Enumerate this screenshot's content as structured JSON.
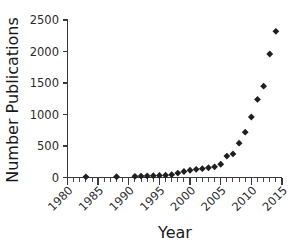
{
  "chart_data": {
    "type": "scatter",
    "title": "",
    "xlabel": "Year",
    "ylabel": "Number Publications",
    "xlim": [
      1980,
      2015
    ],
    "ylim": [
      0,
      2500
    ],
    "xticks": [
      1980,
      1985,
      1990,
      1995,
      2000,
      2005,
      2010,
      2015
    ],
    "xtick_labels": [
      "1980",
      "1985",
      "1990",
      "1995",
      "2000",
      "2005",
      "2010",
      "2015"
    ],
    "yticks": [
      0,
      500,
      1000,
      1500,
      2000,
      2500
    ],
    "ytick_labels": [
      "0",
      "500",
      "1000",
      "1500",
      "2000",
      "2500"
    ],
    "xtick_minor_step": 1,
    "grid": false,
    "legend": null,
    "marker": "diamond",
    "marker_color": "#1f1f1f",
    "x": [
      1983,
      1988,
      1991,
      1992,
      1993,
      1994,
      1995,
      1996,
      1997,
      1998,
      1999,
      2000,
      2001,
      2002,
      2003,
      2004,
      2005,
      2006,
      2007,
      2008,
      2009,
      2010,
      2011,
      2012,
      2013,
      2014
    ],
    "values": [
      10,
      12,
      18,
      22,
      25,
      28,
      32,
      36,
      45,
      70,
      95,
      115,
      130,
      140,
      155,
      170,
      210,
      340,
      375,
      545,
      720,
      960,
      1240,
      1450,
      1960,
      2320
    ],
    "series": [
      {
        "name": "Number Publications",
        "x": [
          1983,
          1988,
          1991,
          1992,
          1993,
          1994,
          1995,
          1996,
          1997,
          1998,
          1999,
          2000,
          2001,
          2002,
          2003,
          2004,
          2005,
          2006,
          2007,
          2008,
          2009,
          2010,
          2011,
          2012,
          2013,
          2014
        ],
        "values": [
          10,
          12,
          18,
          22,
          25,
          28,
          32,
          36,
          45,
          70,
          95,
          115,
          130,
          140,
          155,
          170,
          210,
          340,
          375,
          545,
          720,
          960,
          1240,
          1450,
          1960,
          2320
        ]
      }
    ]
  },
  "figure": {
    "background_color": "#ffffff",
    "axis_color": "#3a3a3a"
  }
}
